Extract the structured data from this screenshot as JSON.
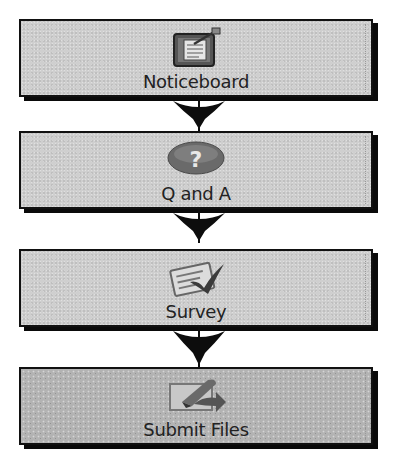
{
  "diagram": {
    "type": "vertical-flowchart",
    "steps": [
      {
        "label": "Noticeboard",
        "icon": "noticeboard-icon"
      },
      {
        "label": "Q and A",
        "icon": "question-mark-icon"
      },
      {
        "label": "Survey",
        "icon": "survey-checklist-icon"
      },
      {
        "label": "Submit Files",
        "icon": "submit-files-icon"
      }
    ],
    "connectors": [
      {
        "from": "Noticeboard",
        "to": "Q and A",
        "icon": "arrow-down-icon"
      },
      {
        "from": "Q and A",
        "to": "Survey",
        "icon": "arrow-down-icon"
      },
      {
        "from": "Survey",
        "to": "Submit Files",
        "icon": "arrow-down-icon"
      }
    ],
    "colors": {
      "box_fill": "#cfcfcf",
      "box_fill_last": "#b3b3b3",
      "border": "#111111",
      "arrow": "#0d0d0d",
      "text": "#222222"
    }
  }
}
